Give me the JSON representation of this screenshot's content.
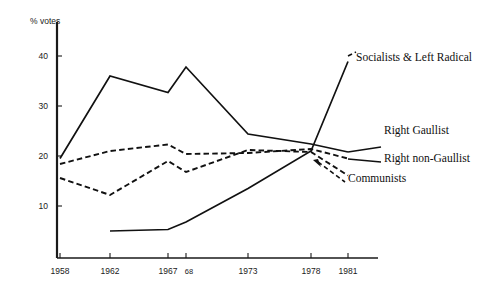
{
  "chart_data": {
    "type": "line",
    "title": "",
    "subtitle": "",
    "xlabel": "",
    "ylabel": "% votes",
    "x": [
      1958,
      1962,
      1967,
      1968,
      1973,
      1978,
      1981
    ],
    "x_tick_labels": [
      "1958",
      "1962",
      "1967",
      "68",
      "1973",
      "1978",
      "1981"
    ],
    "y_tick_labels": [
      "10",
      "20",
      "30",
      "40"
    ],
    "y_ticks": [
      10,
      20,
      30,
      40
    ],
    "ylim": [
      0,
      45
    ],
    "grid": false,
    "legend_position": "right-inline-annotations",
    "series": [
      {
        "name": "Socialists & Left Radical",
        "style": "solid",
        "x": [
          1962,
          1967,
          1968,
          1973,
          1978,
          1981
        ],
        "values": [
          5.0,
          5.3,
          6.8,
          13.5,
          21.0,
          38.9
        ],
        "label": "Socialists & Left Radical"
      },
      {
        "name": "Right Gaullist",
        "style": "solid",
        "x": [
          1958,
          1962,
          1967,
          1968,
          1973,
          1978,
          1981
        ],
        "values": [
          19.5,
          36.0,
          32.7,
          37.8,
          24.4,
          22.4,
          20.8
        ],
        "label": "Right Gaullist"
      },
      {
        "name": "Right non-Gaullist",
        "style": "dashed",
        "x": [
          1958,
          1962,
          1967,
          1968,
          1973,
          1978,
          1981
        ],
        "values": [
          18.4,
          21.0,
          22.3,
          20.4,
          20.6,
          21.4,
          19.5
        ],
        "label": "Right non-Gaullist"
      },
      {
        "name": "Communists",
        "style": "dashed",
        "x": [
          1958,
          1962,
          1967,
          1968,
          1973,
          1978,
          1981
        ],
        "values": [
          15.6,
          12.2,
          19.0,
          16.8,
          21.2,
          20.8,
          16.1
        ],
        "label": "Communists"
      }
    ],
    "annotations": [
      {
        "text": "Socialists & Left Radical",
        "anchor_series": "Socialists & Left Radical"
      },
      {
        "text": "Right Gaullist",
        "anchor_series": "Right Gaullist"
      },
      {
        "text": "Right non-Gaullist",
        "anchor_series": "Right non-Gaullist"
      },
      {
        "text": "Communists",
        "anchor_series": "Communists"
      }
    ],
    "colors": {
      "ink": "#111111",
      "background": "#ffffff"
    }
  },
  "axis": {
    "y_title": "% votes",
    "y_labels": {
      "t40": "40",
      "t30": "30",
      "t20": "20",
      "t10": "10"
    },
    "x_labels": {
      "x1958": "1958",
      "x1962": "1962",
      "x1967": "1967",
      "x68": "68",
      "x1973": "1973",
      "x1978": "1978",
      "x1981": "1981"
    }
  },
  "labels": {
    "socialists": "Socialists & Left Radical",
    "right_gaullist": "Right Gaullist",
    "right_non_gaullist": "Right non-Gaullist",
    "communists": "Communists"
  }
}
